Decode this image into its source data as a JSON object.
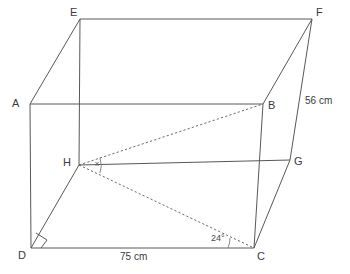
{
  "figure": {
    "shape": "cuboid",
    "vertices": [
      {
        "id": "A",
        "label": "A",
        "x": 30,
        "y": 104,
        "label_x": 12,
        "label_y": 98
      },
      {
        "id": "B",
        "label": "B",
        "x": 263,
        "y": 104,
        "label_x": 268,
        "label_y": 100
      },
      {
        "id": "C",
        "label": "C",
        "x": 254,
        "y": 248,
        "label_x": 257,
        "label_y": 251
      },
      {
        "id": "D",
        "label": "D",
        "x": 31,
        "y": 248,
        "label_x": 18,
        "label_y": 250
      },
      {
        "id": "E",
        "label": "E",
        "x": 80,
        "y": 19,
        "label_x": 70,
        "label_y": 7
      },
      {
        "id": "F",
        "label": "F",
        "x": 312,
        "y": 19,
        "label_x": 316,
        "label_y": 7
      },
      {
        "id": "G",
        "label": "G",
        "x": 290,
        "y": 160,
        "label_x": 294,
        "label_y": 156
      },
      {
        "id": "H",
        "label": "H",
        "x": 79,
        "y": 165,
        "label_x": 63,
        "label_y": 157
      }
    ],
    "edges_solid": [
      {
        "name": "edge-AB",
        "from": "A",
        "to": "B"
      },
      {
        "name": "edge-AE",
        "from": "A",
        "to": "E"
      },
      {
        "name": "edge-AD",
        "from": "A",
        "to": "D"
      },
      {
        "name": "edge-EF",
        "from": "E",
        "to": "F"
      },
      {
        "name": "edge-EH",
        "from": "E",
        "to": "H"
      },
      {
        "name": "edge-FB",
        "from": "F",
        "to": "B"
      },
      {
        "name": "edge-FG",
        "from": "F",
        "to": "G"
      },
      {
        "name": "edge-BC",
        "from": "B",
        "to": "C"
      },
      {
        "name": "edge-DC",
        "from": "D",
        "to": "C"
      },
      {
        "name": "edge-DH",
        "from": "D",
        "to": "H"
      },
      {
        "name": "edge-HG",
        "from": "H",
        "to": "G"
      },
      {
        "name": "edge-GC",
        "from": "G",
        "to": "C"
      }
    ],
    "edges_dashed": [
      {
        "name": "diagonal-HB",
        "from": "H",
        "to": "B"
      },
      {
        "name": "diagonal-HC",
        "from": "H",
        "to": "C"
      }
    ],
    "angles": [
      {
        "id": "angle-x",
        "label": "x",
        "at_vertex": "H",
        "label_x": 95,
        "label_y": 160,
        "marker": "arc"
      },
      {
        "id": "angle-24",
        "label": "24°",
        "at_vertex": "C",
        "label_x": 211,
        "label_y": 234,
        "marker": "arc"
      }
    ],
    "right_angles": [
      {
        "id": "right-angle-D",
        "at_vertex": "D",
        "x": 31,
        "y": 248
      }
    ],
    "dimensions": [
      {
        "id": "dim-width",
        "label": "75 cm",
        "label_x": 120,
        "label_y": 252,
        "edge": "DC"
      },
      {
        "id": "dim-height",
        "label": "56 cm",
        "label_x": 305,
        "label_y": 96,
        "edge": "FG"
      }
    ],
    "colors": {
      "edge": "#58585a",
      "dashed": "#6a6a6c",
      "text": "#3b3b3d",
      "background": "#ffffff"
    }
  }
}
